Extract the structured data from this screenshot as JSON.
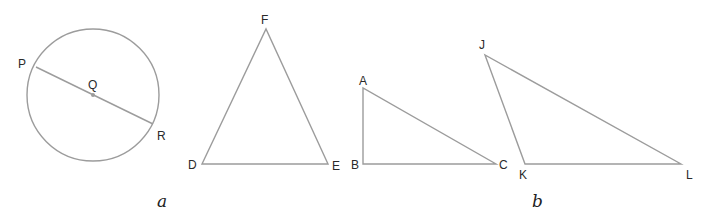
{
  "colors": {
    "background": "#ffffff",
    "stroke": "#9c9c9c",
    "label": "#2a2a2a"
  },
  "figures": {
    "circle": {
      "center": {
        "name": "Q",
        "x": 93,
        "y": 95
      },
      "radius": 66,
      "diameter": {
        "endpoint1": {
          "name": "P",
          "x": 36,
          "y": 67
        },
        "endpoint2": {
          "name": "R",
          "x": 153,
          "y": 124
        }
      },
      "labels": {
        "P": "P",
        "Q": "Q",
        "R": "R"
      }
    },
    "triangle_DEF": {
      "vertices": {
        "D": {
          "x": 202,
          "y": 164
        },
        "E": {
          "x": 328,
          "y": 164
        },
        "F": {
          "x": 266,
          "y": 29
        }
      },
      "labels": {
        "D": "D",
        "E": "E",
        "F": "F"
      }
    },
    "triangle_ABC": {
      "vertices": {
        "A": {
          "x": 363,
          "y": 88
        },
        "B": {
          "x": 363,
          "y": 164
        },
        "C": {
          "x": 496,
          "y": 164
        }
      },
      "labels": {
        "A": "A",
        "B": "B",
        "C": "C"
      }
    },
    "triangle_JKL": {
      "vertices": {
        "J": {
          "x": 485,
          "y": 55
        },
        "K": {
          "x": 525,
          "y": 164
        },
        "L": {
          "x": 681,
          "y": 164
        }
      },
      "labels": {
        "J": "J",
        "K": "K",
        "L": "L"
      }
    }
  },
  "captions": {
    "a": "a",
    "b": "b"
  }
}
